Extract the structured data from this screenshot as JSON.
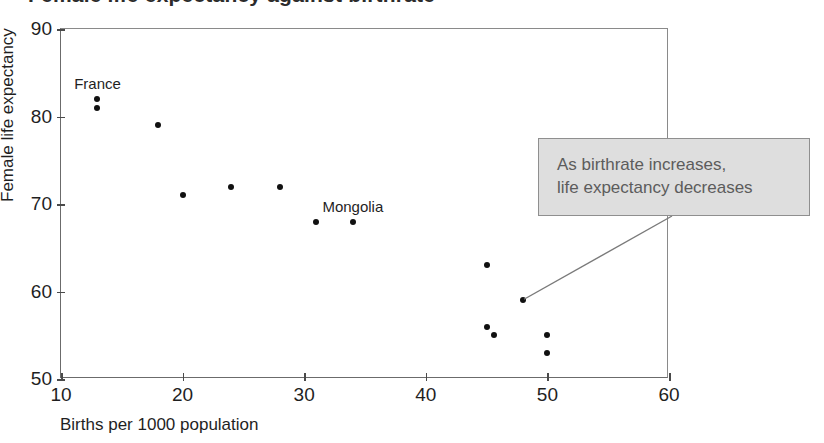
{
  "chart_data": {
    "type": "scatter",
    "title": "Female life expectancy against birthrate",
    "xlabel": "Births per 1000 population",
    "ylabel": "Female life expectancy",
    "xlim": [
      10,
      60
    ],
    "ylim": [
      50,
      90
    ],
    "xticks": [
      "10",
      "20",
      "30",
      "40",
      "50",
      "60"
    ],
    "yticks": [
      "50",
      "60",
      "70",
      "80",
      "90"
    ],
    "grid": false,
    "legend": null,
    "points": [
      {
        "x": 13,
        "y": 82,
        "label": "France"
      },
      {
        "x": 13,
        "y": 81,
        "label": ""
      },
      {
        "x": 18,
        "y": 79,
        "label": ""
      },
      {
        "x": 20,
        "y": 71,
        "label": ""
      },
      {
        "x": 24,
        "y": 72,
        "label": ""
      },
      {
        "x": 28,
        "y": 72,
        "label": ""
      },
      {
        "x": 31,
        "y": 68,
        "label": ""
      },
      {
        "x": 34,
        "y": 68,
        "label": "Mongolia"
      },
      {
        "x": 45,
        "y": 63,
        "label": ""
      },
      {
        "x": 48,
        "y": 59,
        "label": ""
      },
      {
        "x": 45,
        "y": 56,
        "label": ""
      },
      {
        "x": 45.6,
        "y": 55,
        "label": ""
      },
      {
        "x": 50,
        "y": 55,
        "label": ""
      },
      {
        "x": 50,
        "y": 53,
        "label": ""
      }
    ],
    "annotations": [
      {
        "name": "trend-callout",
        "text": "As birthrate increases,\nlife expectancy decreases",
        "points_to": {
          "x": 48,
          "y": 59
        },
        "fill": "#dedede",
        "border": "#8f8f8f",
        "text_color": "#5c5c5c"
      }
    ],
    "point_labels": [
      {
        "text": "France",
        "x": 13,
        "y": 82
      },
      {
        "text": "Mongolia",
        "x": 34,
        "y": 68
      }
    ],
    "colors": {
      "marker": "#111111",
      "axis": "#6b6b6b",
      "text": "#1f1f1f",
      "background": "#ffffff"
    }
  }
}
